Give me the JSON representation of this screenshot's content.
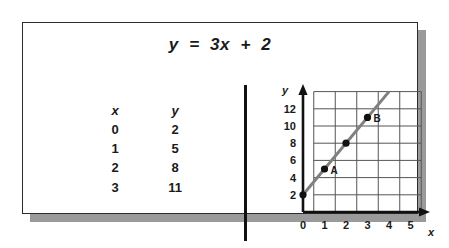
{
  "card": {
    "equation": "y  =  3x  +  2"
  },
  "table": {
    "header_x": "x",
    "header_y": "y",
    "rows": [
      {
        "x": "0",
        "y": "2"
      },
      {
        "x": "1",
        "y": "5"
      },
      {
        "x": "2",
        "y": "8"
      },
      {
        "x": "3",
        "y": "11"
      }
    ]
  },
  "chart_data": {
    "type": "line",
    "title": "y = 3x + 2",
    "xlabel": "x",
    "ylabel": "y",
    "xlim": [
      0,
      6
    ],
    "ylim": [
      0,
      14
    ],
    "x_ticks": [
      "0",
      "1",
      "2",
      "3",
      "4",
      "5"
    ],
    "x_tick_values": [
      0,
      1,
      2,
      3,
      4,
      5
    ],
    "y_ticks": [
      "2",
      "4",
      "6",
      "8",
      "10",
      "12"
    ],
    "y_tick_values": [
      2,
      4,
      6,
      8,
      10,
      12
    ],
    "grid": true,
    "legend": "none",
    "series": [
      {
        "name": "y = 3x + 2",
        "x": [
          0,
          1,
          2,
          3,
          4
        ],
        "values": [
          2,
          5,
          8,
          11,
          14
        ],
        "color": "#808080"
      }
    ],
    "points": [
      {
        "label": "",
        "x": 0,
        "y": 2
      },
      {
        "label": "A",
        "x": 1,
        "y": 5
      },
      {
        "label": "",
        "x": 2,
        "y": 8
      },
      {
        "label": "B",
        "x": 3,
        "y": 11
      }
    ],
    "annotations": [
      {
        "text": "A",
        "x": 1,
        "y": 5
      },
      {
        "text": "B",
        "x": 3,
        "y": 11
      }
    ]
  },
  "colors": {
    "border": "#2c2c2c",
    "shadow": "#9a9a9a",
    "divider": "#111111",
    "line": "#808080",
    "grid": "#555555",
    "axis": "#111111",
    "text": "#1a1a1a"
  }
}
